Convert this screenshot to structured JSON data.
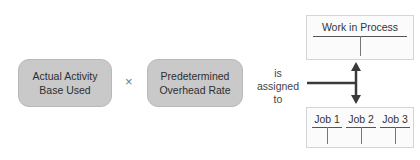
{
  "diagram": {
    "boxes": [
      {
        "id": "actual-activity",
        "lines": [
          "Actual Activity",
          "Base Used"
        ]
      },
      {
        "id": "predetermined-rate",
        "lines": [
          "Predetermined",
          "Overhead Rate"
        ]
      }
    ],
    "operator": "×",
    "connector_text": [
      "is",
      "assigned",
      "to"
    ],
    "targets": {
      "work_in_process": {
        "title": "Work in Process"
      },
      "jobs": [
        {
          "title": "Job 1"
        },
        {
          "title": "Job 2"
        },
        {
          "title": "Job 3"
        }
      ]
    },
    "colors": {
      "box_fill": "#c9c9c9",
      "arrow": "#3a3a3a",
      "account_border": "#d4d4d4"
    }
  }
}
